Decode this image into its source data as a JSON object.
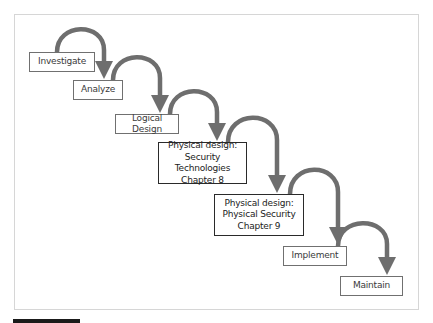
{
  "diagram": {
    "type": "waterfall-sdlc",
    "colors": {
      "arrow": "#6e6e6e",
      "box_border": "#707070",
      "box_border_emphasis": "#2a2a2a",
      "frame": "#d6d6d6",
      "caption_bar": "#1a1a1a"
    },
    "steps": [
      {
        "label": "Investigate",
        "lines": [
          "Investigate"
        ],
        "emphasis": false
      },
      {
        "label": "Analyze",
        "lines": [
          "Analyze"
        ],
        "emphasis": false
      },
      {
        "label": "Logical Design",
        "lines": [
          "Logical Design"
        ],
        "emphasis": false
      },
      {
        "label": "Physical design: Security Technologies Chapter 8",
        "lines": [
          "Physical design:",
          "Security Technologies",
          "Chapter 8"
        ],
        "emphasis": true
      },
      {
        "label": "Physical design: Physical Security Chapter 9",
        "lines": [
          "Physical design:",
          "Physical Security",
          "Chapter 9"
        ],
        "emphasis": true
      },
      {
        "label": "Implement",
        "lines": [
          "Implement"
        ],
        "emphasis": false
      },
      {
        "label": "Maintain",
        "lines": [
          "Maintain"
        ],
        "emphasis": false
      }
    ]
  }
}
